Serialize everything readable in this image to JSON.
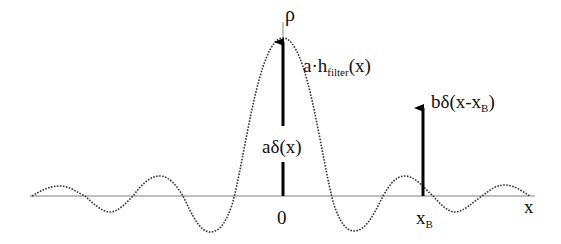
{
  "diagram": {
    "y_axis_label": "ρ",
    "x_axis_label": "x",
    "origin_tick_label": "0",
    "xb_tick_label": {
      "main": "x",
      "sub": "B"
    },
    "curve_label": {
      "prefix": "a·h",
      "sub": "filter",
      "suffix": "(x)"
    },
    "center_impulse_label": "aδ(x)",
    "offset_impulse_label": {
      "prefix": "bδ(x-x",
      "sub": "B",
      "suffix": ")"
    },
    "colors": {
      "axis": "#aaaaaa",
      "curve": "#333333",
      "arrows": "#000000",
      "text": "#111111"
    },
    "curve_style": "dotted sinc-like filter response",
    "impulses": [
      {
        "name": "aδ(x)",
        "x_position": "0",
        "height": "tall"
      },
      {
        "name": "bδ(x-x_B)",
        "x_position": "x_B",
        "height": "short"
      }
    ]
  }
}
